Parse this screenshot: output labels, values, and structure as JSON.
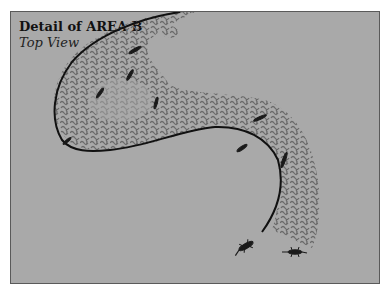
{
  "figure": {
    "title": "Detail of AREA B",
    "subtitle": "Top View"
  },
  "colors": {
    "background": "#a9a9a9",
    "texture": "#6a6a6a",
    "outline": "#111111",
    "lizard": "#1a1a1a"
  },
  "lizards": [
    {
      "id": "lizard-1",
      "x": 135,
      "y": 50,
      "angle": -30
    },
    {
      "id": "lizard-2",
      "x": 130,
      "y": 75,
      "angle": -60
    },
    {
      "id": "lizard-3",
      "x": 100,
      "y": 93,
      "angle": -55
    },
    {
      "id": "lizard-4",
      "x": 156,
      "y": 103,
      "angle": -75
    },
    {
      "id": "lizard-5",
      "x": 260,
      "y": 118,
      "angle": -25
    },
    {
      "id": "lizard-6",
      "x": 243,
      "y": 148,
      "angle": -35
    },
    {
      "id": "lizard-7",
      "x": 284,
      "y": 158,
      "angle": -70
    },
    {
      "id": "lizard-8",
      "x": 65,
      "y": 143,
      "angle": -40
    },
    {
      "id": "lizard-9",
      "x": 246,
      "y": 246,
      "angle": -30
    },
    {
      "id": "lizard-10",
      "x": 295,
      "y": 252,
      "angle": 0
    }
  ]
}
